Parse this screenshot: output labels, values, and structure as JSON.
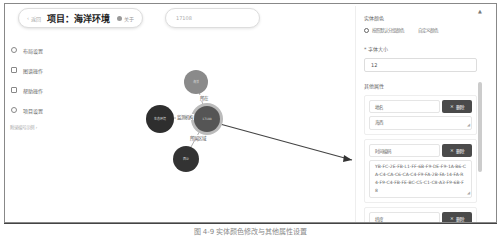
{
  "header": {
    "back_label": "返回",
    "project_title": "项目：海洋环境",
    "about_label": "关于",
    "search_value": "17108"
  },
  "sidebar": {
    "items": [
      {
        "label": "布局设置",
        "icon": "circle-icon"
      },
      {
        "label": "图谱操作",
        "icon": "pencil-icon"
      },
      {
        "label": "帮助操作",
        "icon": "help-icon"
      },
      {
        "label": "项目设置",
        "icon": "gear-icon"
      }
    ],
    "link_label": "附录编号示例 ›"
  },
  "graph": {
    "nodes": [
      {
        "id": "top",
        "label": "海洋",
        "color": "#8a8a8a"
      },
      {
        "id": "left",
        "label": "生态环境",
        "color": "#2e2e2e"
      },
      {
        "id": "center",
        "label": "17108",
        "color": "#555555"
      },
      {
        "id": "bottom",
        "label": "西沙",
        "color": "#333333"
      }
    ],
    "edges": [
      {
        "label": "所在"
      },
      {
        "label": "监测机构"
      },
      {
        "label": "所属区域"
      }
    ]
  },
  "panel": {
    "color_section_label": "实体颜色",
    "radio_options": [
      "按照默认分组颜色",
      "自定义颜色"
    ],
    "font_size_label": "* 字体大小",
    "font_size_value": "12",
    "attributes_label": "其他属性",
    "attributes": [
      {
        "key": "地名",
        "value": "海西",
        "delete_label": "删除"
      },
      {
        "key": "时间编码",
        "value": "YB-FC-2E-FB-L1-FF-6B-F9-DE-F9-1A-B6-CA-C4-CA-C6-CA-C4-F9-FA-2B-FA-14-FA-R4-F9-C4-FB-FE-BC-C5-C1-C8-A3-F9-6B-F8",
        "delete_label": "删除"
      },
      {
        "key": "纬度",
        "value": "17.228812866667",
        "delete_label": "删除"
      },
      {
        "key": "西沙",
        "value": "",
        "delete_label": "删除"
      }
    ]
  },
  "caption": "图 4-9 实体颜色修改与其他属性设置"
}
